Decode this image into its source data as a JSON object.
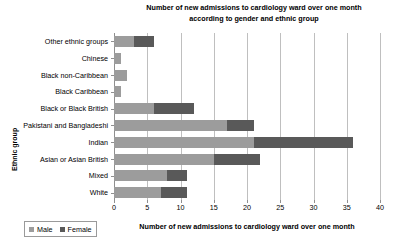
{
  "chart_data": {
    "type": "bar",
    "orientation": "horizontal",
    "stacked": true,
    "title": "Number of new admissions to cardiology ward over one month according to gender and ethnic group",
    "title_lines": [
      "Number of new admissions to cardiology ward over one month",
      "according to gender and ethnic group"
    ],
    "xlabel": "Number of new admissions to cardiology ward over one month",
    "ylabel": "Ethnic group",
    "categories": [
      "White",
      "Mixed",
      "Asian or Asian British",
      "Indian",
      "Pakistani and Bangladeshi",
      "Black or Black British",
      "Black Caribbean",
      "Black non-Caribbean",
      "Chinese",
      "Other ethnic groups"
    ],
    "series": [
      {
        "name": "Male",
        "color": "#9c9c9c",
        "values": [
          7,
          8,
          15,
          21,
          17,
          6,
          1,
          2,
          1,
          3
        ]
      },
      {
        "name": "Female",
        "color": "#595959",
        "values": [
          4,
          3,
          7,
          15,
          4,
          6,
          0,
          0,
          0,
          3
        ]
      }
    ],
    "totals": [
      11,
      11,
      22,
      36,
      21,
      12,
      1,
      2,
      1,
      6
    ],
    "xlim": [
      0,
      40
    ],
    "xticks": [
      0,
      5,
      10,
      15,
      20,
      25,
      30,
      35,
      40
    ],
    "xtick_labels": [
      "0",
      "5",
      "10",
      "15",
      "20",
      "25",
      "30",
      "35",
      "40"
    ],
    "grid": "vertical",
    "legend_position": "bottom-left",
    "legend_entries": [
      "Male",
      "Female"
    ]
  },
  "colors": {
    "male": "#9c9c9c",
    "female": "#595959",
    "gridline": "#bfbfbf",
    "axis": "#8f8f8f",
    "background": "#ffffff",
    "text": "#000000"
  }
}
